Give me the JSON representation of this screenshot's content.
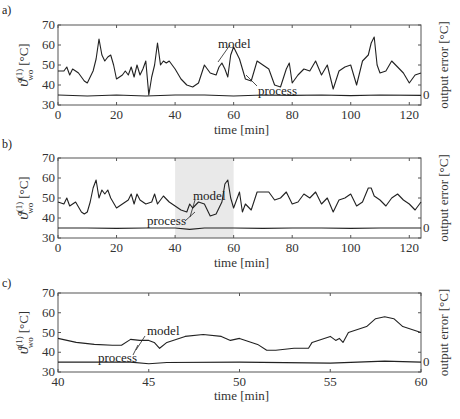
{
  "chart_data": [
    {
      "panel": "a)",
      "type": "line",
      "xlabel": "time  [min]",
      "ylabel": "ϑ_wo^(1) [°C]",
      "ylabel_right": "output error  [°C]",
      "right_tick": "0",
      "xlim": [
        0,
        124
      ],
      "ylim": [
        30,
        70
      ],
      "xticks": [
        "0",
        "20",
        "40",
        "60",
        "80",
        "100",
        "120"
      ],
      "yticks": [
        "30",
        "40",
        "50",
        "60",
        "70"
      ],
      "annotations": [
        "model",
        "process"
      ],
      "series": [
        {
          "name": "process/model",
          "x": [
            0,
            2,
            3,
            4,
            5,
            6,
            7,
            8,
            9,
            10,
            11,
            12,
            13,
            14,
            15,
            16,
            17,
            18,
            19,
            20,
            21,
            22,
            23,
            24,
            25,
            26,
            27,
            28,
            29,
            30,
            31,
            32,
            33,
            34,
            35,
            36,
            37,
            38,
            40,
            42,
            44,
            46,
            48,
            50,
            52,
            54,
            55,
            56,
            57,
            58,
            59,
            60,
            62,
            64,
            66,
            68,
            70,
            72,
            74,
            76,
            78,
            79,
            80,
            82,
            84,
            86,
            88,
            90,
            92,
            94,
            96,
            98,
            100,
            102,
            104,
            106,
            107,
            108,
            109,
            110,
            112,
            114,
            116,
            118,
            120,
            122,
            124
          ],
          "values": [
            47,
            47,
            49,
            45,
            48,
            47,
            46,
            44,
            42,
            41,
            44,
            47,
            53,
            63,
            55,
            52,
            54,
            55,
            50,
            43,
            44,
            45,
            47,
            45,
            49,
            44,
            50,
            45,
            48,
            52,
            35,
            44,
            50,
            61,
            50,
            52,
            51,
            52,
            48,
            43,
            40,
            39,
            41,
            50,
            46,
            45,
            49,
            51,
            48,
            44,
            55,
            59,
            53,
            43,
            42,
            52,
            50,
            48,
            40,
            39,
            48,
            51,
            41,
            45,
            48,
            47,
            52,
            45,
            50,
            38,
            47,
            49,
            50,
            40,
            52,
            55,
            61,
            64,
            50,
            46,
            47,
            52,
            49,
            46,
            41,
            45,
            46
          ]
        },
        {
          "name": "output error",
          "x": [
            0,
            10,
            20,
            30,
            40,
            50,
            60,
            70,
            80,
            90,
            100,
            110,
            124
          ],
          "values": [
            35,
            34.5,
            35,
            34.5,
            35,
            35,
            34.5,
            35,
            34.8,
            35,
            34.7,
            35,
            34.8
          ]
        }
      ]
    },
    {
      "panel": "b)",
      "type": "line",
      "xlabel": "time  [min]",
      "ylabel": "ϑ_wo^(1) [°C]",
      "ylabel_right": "output error  [°C]",
      "right_tick": "0",
      "xlim": [
        0,
        124
      ],
      "ylim": [
        30,
        70
      ],
      "xticks": [
        "0",
        "20",
        "40",
        "60",
        "80",
        "100",
        "120"
      ],
      "yticks": [
        "30",
        "40",
        "50",
        "60",
        "70"
      ],
      "highlight_region": [
        40,
        60
      ],
      "annotations": [
        "model",
        "process"
      ],
      "series": [
        {
          "name": "process/model",
          "x": [
            0,
            2,
            3,
            4,
            6,
            8,
            9,
            10,
            11,
            12,
            13,
            14,
            15,
            16,
            17,
            18,
            20,
            22,
            24,
            25,
            26,
            27,
            28,
            30,
            32,
            33,
            34,
            36,
            38,
            40,
            42,
            44,
            45,
            46,
            48,
            50,
            52,
            54,
            56,
            57,
            58,
            59,
            60,
            62,
            63,
            64,
            66,
            68,
            70,
            72,
            74,
            76,
            78,
            80,
            82,
            84,
            86,
            88,
            90,
            92,
            94,
            96,
            98,
            100,
            102,
            104,
            106,
            107,
            108,
            110,
            112,
            114,
            116,
            118,
            120,
            122,
            124
          ],
          "values": [
            48,
            47,
            50,
            46,
            48,
            43,
            42,
            43,
            48,
            55,
            59,
            50,
            54,
            52,
            54,
            50,
            45,
            47,
            49,
            52,
            47,
            52,
            49,
            47,
            48,
            52,
            47,
            51,
            48,
            46,
            44,
            43,
            47,
            45,
            48,
            47,
            41,
            42,
            48,
            57,
            59,
            50,
            45,
            53,
            43,
            47,
            44,
            53,
            53,
            53,
            49,
            50,
            53,
            47,
            48,
            52,
            50,
            53,
            47,
            50,
            43,
            49,
            50,
            52,
            46,
            48,
            55,
            55,
            51,
            49,
            46,
            50,
            52,
            49,
            47,
            44,
            48
          ]
        },
        {
          "name": "output error",
          "x": [
            0,
            10,
            20,
            30,
            40,
            45,
            50,
            60,
            70,
            80,
            90,
            100,
            110,
            124
          ],
          "values": [
            35,
            35,
            34.8,
            35,
            35,
            34.3,
            35,
            35,
            34.8,
            35,
            35,
            34.8,
            35,
            35
          ]
        }
      ]
    },
    {
      "panel": "c)",
      "type": "line",
      "xlabel": "time  [min]",
      "ylabel": "ϑ_wo^(1) [°C]",
      "ylabel_right": "output error  [°C]",
      "right_tick": "0",
      "xlim": [
        40,
        60
      ],
      "ylim": [
        30,
        70
      ],
      "xticks": [
        "40",
        "45",
        "50",
        "55",
        "60"
      ],
      "yticks": [
        "30",
        "40",
        "50",
        "60",
        "70"
      ],
      "annotations": [
        "model",
        "process"
      ],
      "series": [
        {
          "name": "process/model",
          "x": [
            40,
            41,
            42,
            43,
            43.5,
            44,
            44.5,
            45,
            45.3,
            45.6,
            46,
            47,
            48,
            49,
            49.5,
            50,
            51,
            51.5,
            52,
            53,
            53.8,
            54,
            55,
            55.3,
            55.5,
            55.7,
            56,
            57,
            57.5,
            58,
            58.5,
            59,
            60
          ],
          "values": [
            47,
            45,
            44,
            43.5,
            43.5,
            46.5,
            46,
            46,
            45,
            42,
            45,
            48,
            49,
            48,
            46,
            47,
            44,
            41,
            41,
            42,
            42,
            45,
            48,
            46,
            47,
            45,
            50,
            53,
            57,
            58,
            57,
            53,
            50
          ]
        },
        {
          "name": "output error",
          "x": [
            40,
            44,
            45,
            46,
            50,
            55,
            58,
            60
          ],
          "values": [
            35,
            35,
            34.2,
            34.8,
            35,
            34.5,
            35.5,
            35
          ]
        }
      ]
    }
  ],
  "panels": {
    "a": {
      "label": "a)"
    },
    "b": {
      "label": "b)"
    },
    "c": {
      "label": "c)"
    }
  },
  "labels": {
    "xlabel": "time  [min]",
    "ylabel_main": "ϑ",
    "ylabel_sup": "(1)",
    "ylabel_sub": "wo",
    "ylabel_unit": "[°C]",
    "ylabel_right": "output error  [°C]",
    "model": "model",
    "process": "process",
    "zero": "0"
  },
  "colors": {
    "line": "#222222",
    "axis": "#555555",
    "highlight": "#e9e9e9"
  }
}
